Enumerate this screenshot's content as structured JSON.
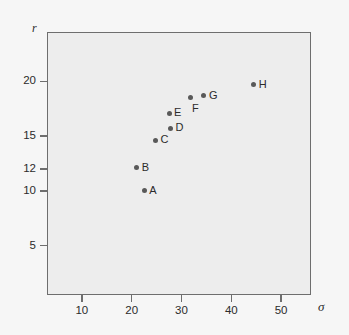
{
  "chart_data": {
    "type": "scatter",
    "title": "",
    "xlabel": "σ",
    "ylabel": "r",
    "xlim": [
      3,
      56
    ],
    "ylim": [
      0.5,
      24.5
    ],
    "grid": false,
    "legend": "none",
    "x_ticks": [
      {
        "value": 10,
        "label": "10"
      },
      {
        "value": 20,
        "label": "20"
      },
      {
        "value": 30,
        "label": "30"
      },
      {
        "value": 40,
        "label": "40"
      },
      {
        "value": 50,
        "label": "50"
      }
    ],
    "y_ticks": [
      {
        "value": 5,
        "label": "5"
      },
      {
        "value": 10,
        "label": "10"
      },
      {
        "value": 12,
        "label": "12"
      },
      {
        "value": 15,
        "label": "15"
      },
      {
        "value": 20,
        "label": "20"
      }
    ],
    "points": [
      {
        "label": "A",
        "x": 22.5,
        "y": 10.0,
        "label_pos": "right"
      },
      {
        "label": "B",
        "x": 21.0,
        "y": 12.1,
        "label_pos": "right"
      },
      {
        "label": "C",
        "x": 24.8,
        "y": 14.6,
        "label_pos": "right"
      },
      {
        "label": "D",
        "x": 27.8,
        "y": 15.7,
        "label_pos": "right"
      },
      {
        "label": "E",
        "x": 27.5,
        "y": 17.1,
        "label_pos": "right"
      },
      {
        "label": "F",
        "x": 31.9,
        "y": 18.5,
        "label_pos": "below-right"
      },
      {
        "label": "G",
        "x": 34.5,
        "y": 18.7,
        "label_pos": "right"
      },
      {
        "label": "H",
        "x": 44.5,
        "y": 19.7,
        "label_pos": "right"
      }
    ],
    "marker_color": "#595959",
    "frame_color": "#6e6e6e",
    "plot_background": "#ededed",
    "figure_background": "#f6f6f6"
  }
}
